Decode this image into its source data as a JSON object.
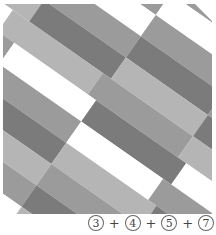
{
  "figure": {
    "colors": {
      "white": "#ffffff",
      "light": "#b5b5b5",
      "mid": "#9b9b9b",
      "dark": "#7b7b7b"
    }
  },
  "caption": {
    "terms": [
      "3",
      "4",
      "5",
      "7"
    ],
    "operator": "+"
  }
}
